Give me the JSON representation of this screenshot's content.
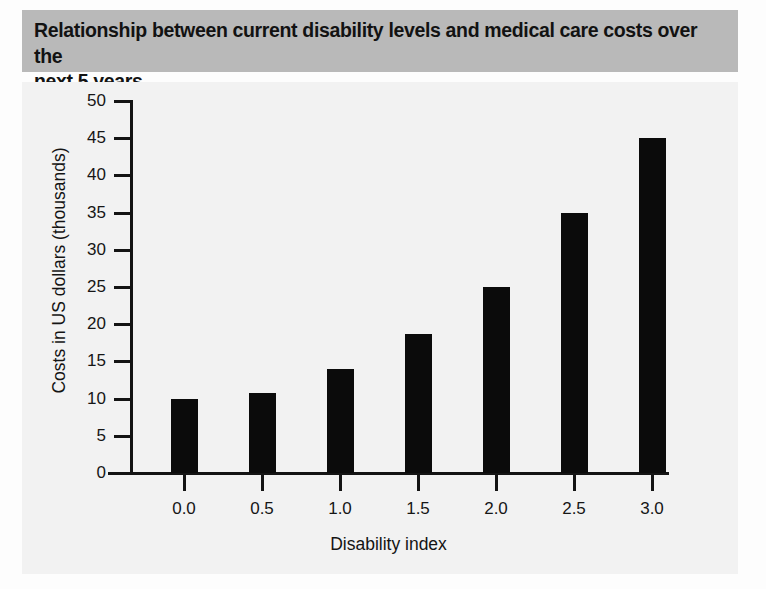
{
  "figure": {
    "title": "Relationship between current disability levels and medical care costs over the\nnext 5 years",
    "title_band_color": "#b9b9b9",
    "panel_color": "#f2f2f2",
    "bar_color": "#0b0b0b",
    "axis_color": "#141414"
  },
  "chart_data": {
    "type": "bar",
    "title": "Relationship between current disability levels and medical care costs over the next 5 years",
    "xlabel": "Disability index",
    "ylabel": "Costs in US dollars (thousands)",
    "categories": [
      "0.0",
      "0.5",
      "1.0",
      "1.5",
      "2.0",
      "2.5",
      "3.0"
    ],
    "x": [
      0.0,
      0.5,
      1.0,
      1.5,
      2.0,
      2.5,
      3.0
    ],
    "values": [
      10.0,
      10.7,
      14.0,
      18.7,
      25.0,
      35.0,
      45.0
    ],
    "ylim": [
      0,
      50
    ],
    "yticks": [
      0,
      5,
      10,
      15,
      20,
      25,
      30,
      35,
      40,
      45,
      50
    ],
    "ytick_labels": [
      "0",
      "5",
      "10",
      "15",
      "20",
      "25",
      "30",
      "35",
      "40",
      "45",
      "50"
    ],
    "xticks": [
      0.0,
      0.5,
      1.0,
      1.5,
      2.0,
      2.5,
      3.0
    ],
    "xtick_labels": [
      "0.0",
      "0.5",
      "1.0",
      "1.5",
      "2.0",
      "2.5",
      "3.0"
    ],
    "grid": false,
    "legend": null,
    "legend_position": "none",
    "series": [
      {
        "name": "Medical care costs",
        "values": [
          10.0,
          10.7,
          14.0,
          18.7,
          25.0,
          35.0,
          45.0
        ]
      }
    ]
  }
}
